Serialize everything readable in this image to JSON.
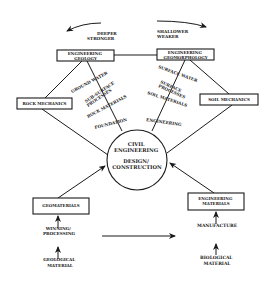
{
  "diagram": {
    "top_arrows": {
      "left_label": [
        "DEEPER",
        "STRONGER"
      ],
      "right_label": [
        "SHALLOWER",
        "WEAKER"
      ]
    },
    "nodes": {
      "engineering_geology": [
        "ENGINEERING",
        "GEOLOGY"
      ],
      "engineering_geomorphology": [
        "ENGINEERING",
        "GEOMORPHOLOGY"
      ],
      "rock_mechanics": "ROCK MECHANICS",
      "soil_mechanics": "SOIL MECHANICS",
      "center": [
        "CIVIL",
        "ENGINEERING",
        "DESIGN/",
        "CONSTRUCTION"
      ],
      "geomaterials": "GEOMATERIALS",
      "engineering_materials": [
        "ENGINEERING",
        "MATERIALS"
      ]
    },
    "left_branch_labels": [
      "GROUND WATER",
      "SUB-SURFACE",
      "PROCESSES",
      "ROCK MATERIALS",
      "FOUNDATION"
    ],
    "right_branch_labels": [
      "SURFACE WATER",
      "SURFACE",
      "PROCESSES",
      "SOIL MATERIALS",
      "ENGINEERING"
    ],
    "bottom_left": {
      "process": [
        "WINNING/",
        "PROCESSING"
      ],
      "source": [
        "GEOLOGICAL",
        "MATERIAL"
      ]
    },
    "bottom_right": {
      "process": "MANUFACTURE",
      "source": [
        "BIOLOGICAL",
        "MATERIAL"
      ]
    },
    "colors": {
      "ink": "#1a1a1a",
      "background": "#ffffff"
    }
  }
}
